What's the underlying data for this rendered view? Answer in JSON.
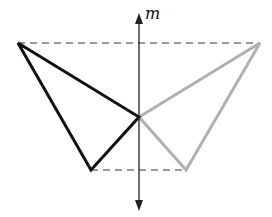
{
  "diagram": {
    "axis_label": "m",
    "colors": {
      "original": "#111111",
      "image": "#b0b0b0",
      "axis": "#222222",
      "dashed": "#333333"
    },
    "axis": {
      "x": 139,
      "y_top": 13,
      "y_bottom": 211
    },
    "original_triangle": [
      [
        18,
        43
      ],
      [
        139,
        117
      ],
      [
        91,
        170
      ]
    ],
    "reflected_triangle": [
      [
        260,
        43
      ],
      [
        139,
        117
      ],
      [
        186,
        170
      ]
    ],
    "dashed_lines": [
      {
        "from": [
          18,
          43
        ],
        "to": [
          260,
          43
        ]
      },
      {
        "from": [
          91,
          170
        ],
        "to": [
          186,
          170
        ]
      }
    ]
  }
}
